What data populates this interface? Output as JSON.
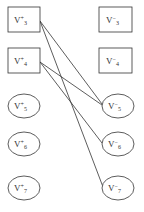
{
  "diagram": {
    "type": "bipartite-graph",
    "left_nodes": [
      {
        "id": "L3",
        "base": "V",
        "sup": "+",
        "sub": "3",
        "shape": "rect",
        "cx": 24,
        "cy": 19.5
      },
      {
        "id": "L4",
        "base": "V",
        "sup": "+",
        "sub": "4",
        "shape": "rect",
        "cx": 24,
        "cy": 60.5
      },
      {
        "id": "L5",
        "base": "V",
        "sup": "+",
        "sub": "5",
        "shape": "ellipse",
        "cx": 24,
        "cy": 106
      },
      {
        "id": "L6",
        "base": "V",
        "sup": "+",
        "sub": "6",
        "shape": "ellipse",
        "cx": 24,
        "cy": 144
      },
      {
        "id": "L7",
        "base": "V",
        "sup": "+",
        "sub": "7",
        "shape": "ellipse",
        "cx": 24,
        "cy": 188
      }
    ],
    "right_nodes": [
      {
        "id": "R3",
        "base": "V",
        "sup": "−",
        "sub": "3",
        "shape": "rect",
        "cx": 116,
        "cy": 19.5
      },
      {
        "id": "R4",
        "base": "V",
        "sup": "−",
        "sub": "4",
        "shape": "rect",
        "cx": 116,
        "cy": 60.5
      },
      {
        "id": "R5",
        "base": "V",
        "sup": "−",
        "sub": "5",
        "shape": "ellipse",
        "cx": 118,
        "cy": 106
      },
      {
        "id": "R6",
        "base": "V",
        "sup": "−",
        "sub": "6",
        "shape": "ellipse",
        "cx": 118,
        "cy": 144
      },
      {
        "id": "R7",
        "base": "V",
        "sup": "−",
        "sub": "7",
        "shape": "ellipse",
        "cx": 118,
        "cy": 188
      }
    ],
    "edges": [
      {
        "from": "L3",
        "to": "R5"
      },
      {
        "from": "L3",
        "to": "R7"
      },
      {
        "from": "L4",
        "to": "R5"
      },
      {
        "from": "L4",
        "to": "R6"
      }
    ],
    "colors": {
      "stroke": "#333333",
      "background": "#ffffff"
    }
  }
}
